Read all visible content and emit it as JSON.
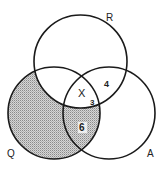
{
  "diagram": {
    "type": "venn",
    "sets": [
      {
        "id": "R",
        "label": "R"
      },
      {
        "id": "Q",
        "label": "Q"
      },
      {
        "id": "A",
        "label": "A"
      }
    ],
    "regions": {
      "R_Q_A": "X",
      "R_A_only": "4",
      "R_Q_A_sub": "3",
      "Q_A_only": "6"
    },
    "shaded": "Q minus R",
    "colors": {
      "stroke": "#1a1a1a",
      "shade": "#bdbdbd",
      "background": "#ffffff"
    }
  }
}
